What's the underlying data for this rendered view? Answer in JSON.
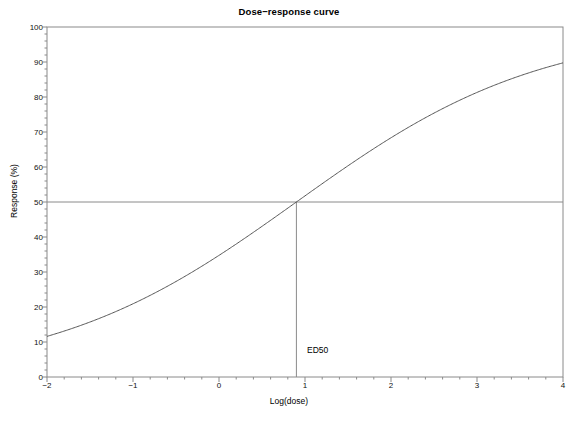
{
  "chart_data": {
    "type": "line",
    "title": "Dose−response curve",
    "xlabel": "Log(dose)",
    "ylabel": "Response (%)",
    "xlim": [
      -2,
      4
    ],
    "ylim": [
      0,
      100
    ],
    "grid": false,
    "legend": null,
    "xticks": [
      -2,
      -1,
      0,
      1,
      2,
      3,
      4
    ],
    "xtick_labels": [
      "−2",
      "−1",
      "0",
      "1",
      "2",
      "3",
      "4"
    ],
    "yticks": [
      0,
      10,
      20,
      30,
      40,
      50,
      60,
      70,
      80,
      90,
      100
    ],
    "ytick_labels": [
      "0",
      "10",
      "20",
      "30",
      "40",
      "50",
      "60",
      "70",
      "80",
      "90",
      "100"
    ],
    "xminor_step": 0.2,
    "yminor_step": 2,
    "series": [
      {
        "name": "dose-response",
        "color": "#555555",
        "width": 1,
        "model": "logistic",
        "ed50": 0.9,
        "slope": 0.7,
        "top": 100,
        "bottom": 0,
        "x": [
          -2.0,
          -1.8,
          -1.6,
          -1.4,
          -1.2,
          -1.0,
          -0.8,
          -0.6,
          -0.4,
          -0.2,
          0.0,
          0.2,
          0.4,
          0.6,
          0.8,
          1.0,
          1.2,
          1.4,
          1.6,
          1.8,
          2.0,
          2.2,
          2.4,
          2.6,
          2.8,
          3.0,
          3.2,
          3.4,
          3.6,
          3.8,
          4.0
        ],
        "y": [
          4.1,
          4.7,
          5.4,
          6.2,
          7.1,
          8.1,
          9.3,
          10.6,
          12.1,
          13.8,
          15.7,
          17.8,
          20.2,
          22.8,
          25.7,
          28.8,
          32.1,
          35.7,
          39.4,
          43.3,
          47.3,
          51.3,
          55.3,
          59.2,
          63.0,
          66.7,
          70.2,
          73.5,
          76.5,
          79.3,
          81.9
        ]
      }
    ],
    "annotations": [
      {
        "name": "ed50-marker",
        "label": "ED50",
        "x": 0.9,
        "y": 50,
        "vline_from": 0,
        "vline_to": 50,
        "hline_y": 50,
        "hline_from": -2,
        "hline_to": 4,
        "line_color": "#8a8a8a",
        "label_x": 1.0,
        "label_y": 7.5
      }
    ]
  },
  "style": {
    "frame_color": "#8a8a8a",
    "tick_color": "#8a8a8a",
    "background": "#ffffff",
    "text_color": "#000000"
  }
}
